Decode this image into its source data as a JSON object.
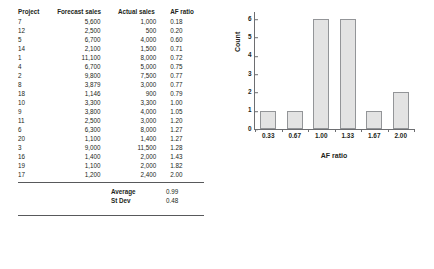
{
  "table": {
    "headers": [
      "Project",
      "Forecast sales",
      "Actual sales",
      "AF ratio"
    ],
    "rows": [
      {
        "project": "7",
        "forecast": "5,600",
        "actual": "1,000",
        "af": "0.18"
      },
      {
        "project": "12",
        "forecast": "2,500",
        "actual": "500",
        "af": "0.20"
      },
      {
        "project": "5",
        "forecast": "6,700",
        "actual": "4,000",
        "af": "0.60"
      },
      {
        "project": "14",
        "forecast": "2,100",
        "actual": "1,500",
        "af": "0.71"
      },
      {
        "project": "1",
        "forecast": "11,100",
        "actual": "8,000",
        "af": "0.72"
      },
      {
        "project": "4",
        "forecast": "6,700",
        "actual": "5,000",
        "af": "0.75"
      },
      {
        "project": "2",
        "forecast": "9,800",
        "actual": "7,500",
        "af": "0.77"
      },
      {
        "project": "8",
        "forecast": "3,879",
        "actual": "3,000",
        "af": "0.77"
      },
      {
        "project": "18",
        "forecast": "1,146",
        "actual": "900",
        "af": "0.79"
      },
      {
        "project": "10",
        "forecast": "3,300",
        "actual": "3,300",
        "af": "1.00"
      },
      {
        "project": "9",
        "forecast": "3,800",
        "actual": "4,000",
        "af": "1.05"
      },
      {
        "project": "11",
        "forecast": "2,500",
        "actual": "3,000",
        "af": "1.20"
      },
      {
        "project": "6",
        "forecast": "6,300",
        "actual": "8,000",
        "af": "1.27"
      },
      {
        "project": "20",
        "forecast": "1,100",
        "actual": "1,400",
        "af": "1.27"
      },
      {
        "project": "3",
        "forecast": "9,000",
        "actual": "11,500",
        "af": "1.28"
      },
      {
        "project": "16",
        "forecast": "1,400",
        "actual": "2,000",
        "af": "1.43"
      },
      {
        "project": "19",
        "forecast": "1,100",
        "actual": "2,000",
        "af": "1.82"
      },
      {
        "project": "17",
        "forecast": "1,200",
        "actual": "2,400",
        "af": "2.00"
      }
    ],
    "summary": [
      {
        "label": "Average",
        "value": "0.99"
      },
      {
        "label": "St Dev",
        "value": "0.48"
      }
    ]
  },
  "chart_data": {
    "type": "bar",
    "title": "",
    "xlabel": "AF ratio",
    "ylabel": "Count",
    "categories": [
      "0.33",
      "0.67",
      "1.00",
      "1.33",
      "1.67",
      "2.00"
    ],
    "values": [
      1,
      1,
      6,
      6,
      1,
      2
    ],
    "yticks": [
      "0",
      "1",
      "2",
      "3",
      "4",
      "5",
      "6"
    ],
    "ylim": [
      0,
      6.4
    ],
    "grid": false,
    "legend": "none",
    "bar_fill": "#e3e3e3",
    "bar_stroke": "#939598",
    "axis_color": "#6d6e71"
  }
}
